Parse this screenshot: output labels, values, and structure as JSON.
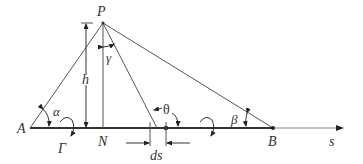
{
  "diagram": {
    "labels": {
      "P": "P",
      "A": "A",
      "B": "B",
      "N": "N",
      "h": "h",
      "alpha": "α",
      "beta": "β",
      "gamma": "γ",
      "theta": "θ",
      "Gamma": "Γ",
      "ds": "ds",
      "s": "s"
    },
    "colors": {
      "line": "#333333",
      "thin_line": "#555555",
      "axis": "#777777",
      "background": "#ffffff"
    }
  }
}
